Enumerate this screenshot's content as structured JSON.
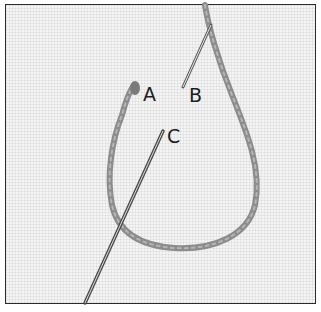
{
  "figure": {
    "labels": {
      "a": "A",
      "b": "B",
      "c": "C"
    },
    "colors": {
      "fabric": "#f4f4f4",
      "thread": "#8a8a8a",
      "needle": "#6a6a6a",
      "border": "#2a2a2a"
    }
  }
}
